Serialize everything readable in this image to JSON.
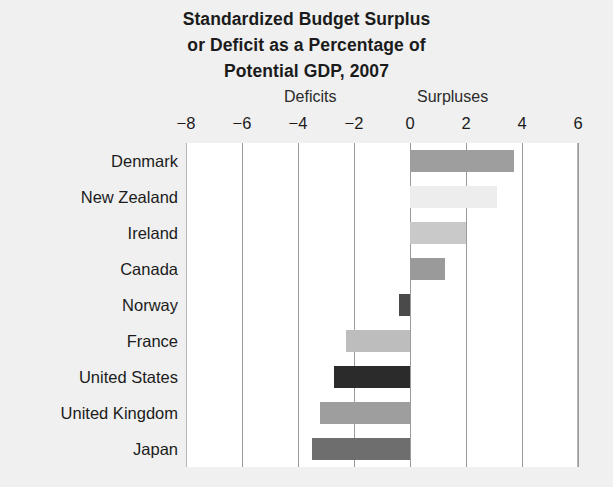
{
  "chart_data": {
    "type": "bar",
    "orientation": "horizontal",
    "title": "Standardized Budget Surplus or Deficit as a Percentage of Potential GDP, 2007",
    "title_lines": [
      "Standardized Budget Surplus",
      "or Deficit as a Percentage of",
      "Potential GDP, 2007"
    ],
    "categories": [
      "Denmark",
      "New Zealand",
      "Ireland",
      "Canada",
      "Norway",
      "France",
      "United States",
      "United Kingdom",
      "Japan"
    ],
    "values": [
      3.7,
      3.1,
      2.0,
      1.25,
      -0.4,
      -2.3,
      -2.7,
      -3.2,
      -3.5
    ],
    "bar_colors": [
      "#9e9e9e",
      "#ededed",
      "#c9c9c9",
      "#9a9a9a",
      "#4a4a4a",
      "#bdbdbd",
      "#2b2b2b",
      "#9e9e9e",
      "#6e6e6e"
    ],
    "xlabel": "",
    "ylabel": "",
    "xlim": [
      -8,
      6
    ],
    "xticks": [
      -8,
      -6,
      -4,
      -2,
      0,
      2,
      4,
      6
    ],
    "xticklabels": [
      "−8",
      "−6",
      "−4",
      "−2",
      "0",
      "2",
      "4",
      "6"
    ],
    "grid": true,
    "legend": false,
    "annotations": [
      {
        "text": "Deficits",
        "side": "left"
      },
      {
        "text": "Surpluses",
        "side": "right"
      }
    ]
  },
  "colors": {
    "page_background": "#f0f0f0",
    "plot_background": "#ffffff",
    "gridline": "#9a9a9a",
    "text": "#1b1b1b"
  }
}
